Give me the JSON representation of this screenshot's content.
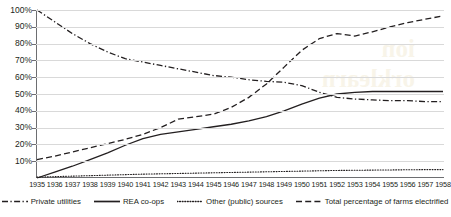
{
  "chart_data": {
    "type": "line",
    "title": "",
    "subtitle": "",
    "xlabel": "",
    "ylabel": "",
    "x": [
      1935,
      1936,
      1937,
      1938,
      1939,
      1940,
      1941,
      1942,
      1943,
      1944,
      1945,
      1946,
      1947,
      1948,
      1949,
      1950,
      1951,
      1952,
      1953,
      1954,
      1955,
      1956,
      1957,
      1958
    ],
    "xtick_labels": [
      "1935",
      "1936",
      "1937",
      "1938",
      "1939",
      "1940",
      "1941",
      "1942",
      "1943",
      "1944",
      "1945",
      "1946",
      "1947",
      "1948",
      "1949",
      "1950",
      "1951",
      "1952",
      "1953",
      "1954",
      "1955",
      "1956",
      "1957",
      "1958"
    ],
    "ytick_labels": [
      "10%",
      "20%",
      "30%",
      "40%",
      "50%",
      "60%",
      "70%",
      "80%",
      "90%",
      "100%"
    ],
    "ytick_values": [
      10,
      20,
      30,
      40,
      50,
      60,
      70,
      80,
      90,
      100
    ],
    "ylim": [
      0,
      100
    ],
    "xlim": [
      1935,
      1958
    ],
    "grid": "horizontal",
    "legend_position": "bottom",
    "series": [
      {
        "name": "Private utilities",
        "style": "dash-dot",
        "color": "#231f20",
        "values": [
          100,
          93,
          86,
          80,
          75,
          71,
          69,
          67,
          65,
          63,
          61,
          60,
          58.5,
          57.5,
          57,
          55,
          51,
          48,
          47,
          46.5,
          46,
          46,
          45.5,
          45.5
        ]
      },
      {
        "name": "REA co-ops",
        "style": "solid",
        "color": "#231f20",
        "values": [
          0,
          3.5,
          7,
          11,
          15,
          19.5,
          23.5,
          26,
          27.5,
          29,
          30.5,
          32,
          34,
          36.5,
          40,
          44,
          47.5,
          50,
          51,
          51.5,
          51.5,
          51.5,
          51.5,
          51.5
        ]
      },
      {
        "name": "Other (public) sources",
        "style": "dotted",
        "color": "#231f20",
        "values": [
          0.5,
          0.8,
          1.1,
          1.4,
          1.7,
          2.0,
          2.3,
          2.5,
          2.7,
          2.9,
          3.1,
          3.3,
          3.5,
          3.7,
          3.9,
          4.1,
          4.3,
          4.5,
          4.6,
          4.7,
          4.8,
          4.9,
          5.0,
          5.0
        ]
      },
      {
        "name": "Total percentage of farms electrified",
        "style": "dashed",
        "color": "#231f20",
        "values": [
          11,
          13,
          15.5,
          18,
          20.5,
          23,
          26,
          30,
          35,
          36.5,
          38,
          42,
          48,
          56,
          66,
          76,
          83,
          86,
          84.5,
          87,
          90,
          92.5,
          94.5,
          96.5
        ]
      }
    ]
  },
  "legend": {
    "items": [
      {
        "label": "Private utilities",
        "style": "dash-dot"
      },
      {
        "label": "REA co-ops",
        "style": "solid"
      },
      {
        "label": "Other (public) sources",
        "style": "dotted"
      },
      {
        "label": "Total percentage of farms electrified",
        "style": "dashed"
      }
    ]
  },
  "watermark": {
    "line1": "ion",
    "line2": "orklearn"
  },
  "colors": {
    "ink": "#231f20",
    "gridline": "#d9d9d9",
    "axis": "#6d6e71",
    "background": "#ffffff"
  }
}
